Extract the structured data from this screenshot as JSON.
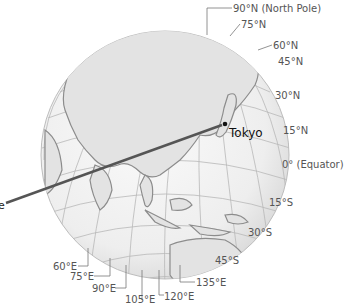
{
  "figure": {
    "type": "globe-diagram",
    "colors": {
      "ocean": "#f2f2f2",
      "land": "#e4e4e4",
      "coast": "#8a8a8a",
      "grid": "#b5b5b5",
      "label": "#555555",
      "pointer": "#555555"
    }
  },
  "latitude_labels": [
    {
      "text": "90°N (North Pole)"
    },
    {
      "text": "75°N"
    },
    {
      "text": "60°N"
    },
    {
      "text": "45°N"
    },
    {
      "text": "30°N"
    },
    {
      "text": "15°N"
    },
    {
      "text": "0° (Equator)"
    },
    {
      "text": "15°S"
    },
    {
      "text": "30°S"
    },
    {
      "text": "45°S"
    }
  ],
  "longitude_labels": [
    {
      "text": "60°E"
    },
    {
      "text": "75°E"
    },
    {
      "text": "90°E"
    },
    {
      "text": "105°E"
    },
    {
      "text": "120°E"
    },
    {
      "text": "135°E"
    }
  ],
  "city": {
    "name": "Tokyo"
  },
  "pointer": {
    "label_fragment": "e"
  }
}
